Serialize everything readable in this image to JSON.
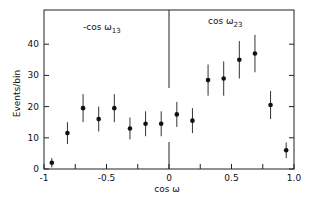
{
  "chart_data": {
    "type": "scatter",
    "title": "",
    "xlabel": "cos ω",
    "ylabel": "Events/bin",
    "xlim": [
      -1,
      1
    ],
    "ylim": [
      0,
      48
    ],
    "grid": false,
    "x_ticks": [
      -1,
      -0.75,
      -0.5,
      -0.25,
      0,
      0.25,
      0.5,
      0.75,
      1.0
    ],
    "x_tick_labels": [
      "-1",
      "",
      "-0.5",
      "",
      "0",
      "",
      "0.5",
      "",
      "1.0"
    ],
    "y_ticks": [
      0,
      10,
      20,
      30,
      40
    ],
    "y_tick_labels": [
      "0",
      "10",
      "20",
      "30",
      "40"
    ],
    "annotations": [
      {
        "text": "-cos ω",
        "sub": "13",
        "region": "left"
      },
      {
        "text": "cos ω",
        "sub": "23",
        "region": "right"
      }
    ],
    "divider_x": 0,
    "series": [
      {
        "name": "Events",
        "x": [
          -0.9375,
          -0.8125,
          -0.6875,
          -0.5625,
          -0.4375,
          -0.3125,
          -0.1875,
          -0.0625,
          0.0625,
          0.1875,
          0.3125,
          0.4375,
          0.5625,
          0.6875,
          0.8125,
          0.9375
        ],
        "y": [
          2,
          11.5,
          19.5,
          16,
          19.5,
          13,
          14.5,
          14.5,
          17.5,
          15.5,
          28.5,
          29,
          35,
          37,
          20.5,
          6
        ],
        "yerr": [
          1.5,
          3.5,
          4.5,
          4,
          4.5,
          3.5,
          4,
          4,
          4,
          4,
          5,
          5.5,
          6,
          6,
          4.5,
          2.5
        ]
      }
    ]
  }
}
